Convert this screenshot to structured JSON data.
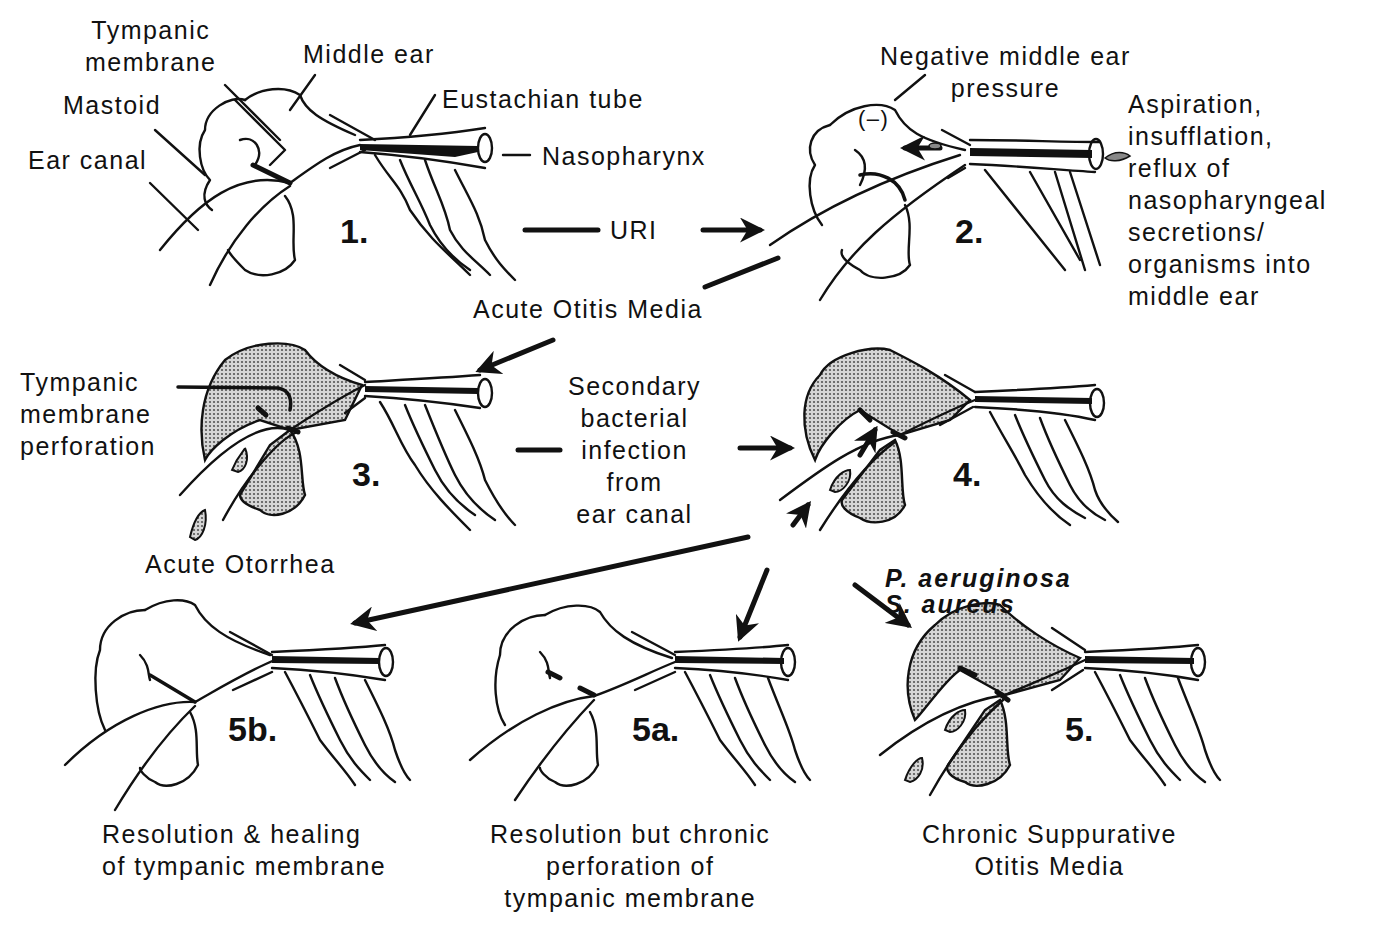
{
  "colors": {
    "ink": "#111111",
    "background": "#ffffff",
    "shading": "#9a9a9a"
  },
  "anatomy_labels": {
    "tympanic_membrane": "Tympanic\nmembrane",
    "middle_ear": "Middle ear",
    "mastoid": "Mastoid",
    "eustachian_tube": "Eustachian tube",
    "ear_canal": "Ear canal",
    "nasopharynx": "Nasopharynx"
  },
  "stages": [
    {
      "id": "1",
      "label": "1.",
      "state": "normal"
    },
    {
      "id": "2",
      "label": "2.",
      "state": "negative pressure",
      "annotations": [
        "Negative middle ear\npressure",
        "(–)"
      ]
    },
    {
      "id": "3",
      "label": "3.",
      "state": "acute otitis media with perforation"
    },
    {
      "id": "4",
      "label": "4.",
      "state": "secondary bacterial infection"
    },
    {
      "id": "5b",
      "label": "5b.",
      "caption": "Resolution & healing\nof tympanic membrane"
    },
    {
      "id": "5a",
      "label": "5a.",
      "caption": "Resolution but chronic\nperforation of\ntympanic membrane"
    },
    {
      "id": "5",
      "label": "5.",
      "caption": "Chronic Suppurative\nOtitis Media"
    }
  ],
  "transitions": {
    "uri": "URI",
    "aspiration": "Aspiration,\ninsufflation,\nreflux of\nnasopharyngeal\nsecretions/\norganisms into\nmiddle ear",
    "aom": "Acute Otitis Media",
    "tm_perforation": "Tympanic\nmembrane\nperforation",
    "acute_otorrhea": "Acute Otorrhea",
    "secondary_infection": "Secondary\nbacterial\ninfection\nfrom\near canal",
    "organisms": "P. aeruginosa\nS. aureus"
  }
}
